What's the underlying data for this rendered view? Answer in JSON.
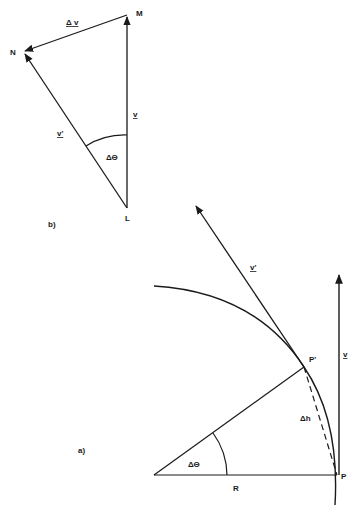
{
  "figure_b": {
    "panel_label": "b)",
    "points": {
      "M": {
        "label": "M",
        "x": 127,
        "y": 15
      },
      "N": {
        "label": "N",
        "x": 23,
        "y": 52
      },
      "L": {
        "label": "L",
        "x": 127,
        "y": 208
      }
    },
    "vectors": {
      "delta_v": {
        "label": "Δ v",
        "from": "M",
        "to": "N"
      },
      "v": {
        "label": "v",
        "from": "L",
        "to": "M"
      },
      "v_prime": {
        "label": "v'",
        "from": "L",
        "to": "N"
      }
    },
    "angle_label": "ΔΘ"
  },
  "figure_a": {
    "panel_label": "a)",
    "points": {
      "O": {
        "x": 154,
        "y": 475
      },
      "P": {
        "label": "P",
        "x": 337,
        "y": 475
      },
      "P_prime": {
        "label": "P'",
        "x": 304,
        "y": 367
      }
    },
    "vectors": {
      "v": {
        "label": "v"
      },
      "v_prime": {
        "label": "v'"
      }
    },
    "radius_label": "R",
    "chord_label": "Δh",
    "angle_label": "ΔΘ"
  }
}
